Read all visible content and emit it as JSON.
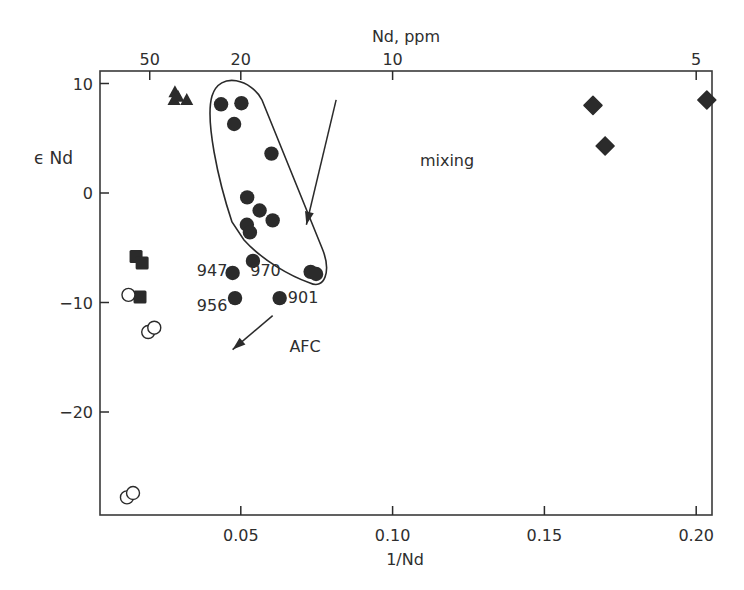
{
  "chart_data": {
    "type": "scatter",
    "title": "",
    "xlabel": "1/Nd",
    "ylabel": "ε Nd",
    "top_axis_label": "Nd, ppm",
    "xlim": [
      0.0036,
      0.208
    ],
    "ylim": [
      -29.5,
      11.0
    ],
    "grid": false,
    "legend": "none",
    "x_ticks": [
      {
        "value": 0.05,
        "label": "0.05"
      },
      {
        "value": 0.1,
        "label": "0.10"
      },
      {
        "value": 0.15,
        "label": "0.15"
      },
      {
        "value": 0.2,
        "label": "0.20"
      }
    ],
    "y_ticks": [
      {
        "value": 10,
        "label": "10"
      },
      {
        "value": 0,
        "label": "0"
      },
      {
        "value": -10,
        "label": "-10"
      },
      {
        "value": -20,
        "label": "-20"
      }
    ],
    "top_ticks": [
      {
        "value": 0.02,
        "label": "50"
      },
      {
        "value": 0.05,
        "label": "20"
      },
      {
        "value": 0.1,
        "label": "10"
      },
      {
        "value": 0.2,
        "label": "5"
      }
    ],
    "series": [
      {
        "name": "filled circles",
        "marker": "circle-filled",
        "points": [
          {
            "x": 0.0435,
            "y": 8.1
          },
          {
            "x": 0.0502,
            "y": 8.2
          },
          {
            "x": 0.0478,
            "y": 6.3
          },
          {
            "x": 0.0601,
            "y": 3.6
          },
          {
            "x": 0.0521,
            "y": -0.4
          },
          {
            "x": 0.0562,
            "y": -1.6
          },
          {
            "x": 0.0605,
            "y": -2.5
          },
          {
            "x": 0.052,
            "y": -2.9
          },
          {
            "x": 0.053,
            "y": -3.6
          },
          {
            "x": 0.054,
            "y": -6.2
          },
          {
            "x": 0.073,
            "y": -7.2
          },
          {
            "x": 0.0748,
            "y": -7.4
          },
          {
            "x": 0.0473,
            "y": -7.3,
            "label": "947"
          },
          {
            "x": 0.0481,
            "y": -9.6,
            "label": "956"
          },
          {
            "x": 0.0628,
            "y": -9.6,
            "label": "901"
          }
        ]
      },
      {
        "name": "filled triangles",
        "marker": "triangle-filled",
        "points": [
          {
            "x": 0.0283,
            "y": 9.2
          },
          {
            "x": 0.028,
            "y": 8.5
          },
          {
            "x": 0.0293,
            "y": 8.8
          },
          {
            "x": 0.0322,
            "y": 8.5
          }
        ]
      },
      {
        "name": "filled squares",
        "marker": "square-filled",
        "points": [
          {
            "x": 0.0155,
            "y": -5.8
          },
          {
            "x": 0.0175,
            "y": -6.4
          },
          {
            "x": 0.0168,
            "y": -9.5
          }
        ]
      },
      {
        "name": "open circles",
        "marker": "circle-open",
        "points": [
          {
            "x": 0.013,
            "y": -9.3
          },
          {
            "x": 0.0195,
            "y": -12.7
          },
          {
            "x": 0.0215,
            "y": -12.3
          },
          {
            "x": 0.0125,
            "y": -27.8
          },
          {
            "x": 0.0145,
            "y": -27.4
          }
        ]
      },
      {
        "name": "filled diamonds",
        "marker": "diamond-filled",
        "points": [
          {
            "x": 0.166,
            "y": 8.0
          },
          {
            "x": 0.17,
            "y": 4.3
          },
          {
            "x": 0.2035,
            "y": 8.5
          }
        ]
      }
    ],
    "annotations": [
      {
        "text": "mixing",
        "type": "arrow-label",
        "x": 0.109,
        "y": 2.5
      },
      {
        "text": "AFC",
        "type": "arrow-label",
        "x": 0.066,
        "y": -14.5
      },
      {
        "text": "947",
        "x": 0.0355,
        "y": -7.6
      },
      {
        "text": "970",
        "x": 0.0531,
        "y": -7.6
      },
      {
        "text": "956",
        "x": 0.0355,
        "y": -10.8
      },
      {
        "text": "901",
        "x": 0.0655,
        "y": -10.0
      }
    ],
    "mixing_arrow": {
      "from": [
        0.0814,
        8.5
      ],
      "to": [
        0.0716,
        -2.9
      ]
    },
    "afc_arrow": {
      "from": [
        0.0605,
        -11.2
      ],
      "to": [
        0.0473,
        -14.3
      ]
    }
  }
}
